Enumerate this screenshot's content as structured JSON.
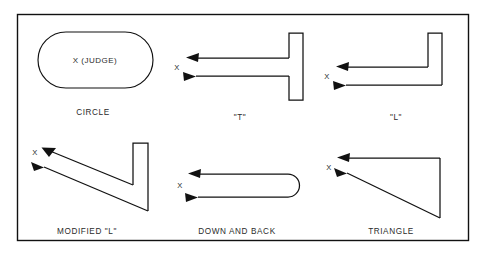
{
  "figure": {
    "background_color": "#ffffff",
    "line_color": "#111111",
    "frame": {
      "x": 17,
      "y": 14,
      "width": 452,
      "height": 227
    }
  },
  "panels": [
    {
      "id": "circle",
      "label": "CIRCLE",
      "label_x": 93,
      "label_y": 112,
      "shape": "stadium",
      "marker_text": "X (JUDGE)",
      "marker_x": 95,
      "marker_y": 62
    },
    {
      "id": "t-shape",
      "label": "\"T\"",
      "label_x": 240,
      "label_y": 118,
      "shape": "t-path",
      "marker_text": "X",
      "marker_x": 180,
      "marker_y": 70
    },
    {
      "id": "l-shape",
      "label": "\"L\"",
      "label_x": 396,
      "label_y": 118,
      "shape": "l-path",
      "marker_text": "X",
      "marker_x": 330,
      "marker_y": 79
    },
    {
      "id": "modified-l",
      "label": "MODIFIED \"L\"",
      "label_x": 87,
      "label_y": 232,
      "shape": "modified-l-path",
      "marker_text": "X",
      "marker_x": 37,
      "marker_y": 153
    },
    {
      "id": "down-and-back",
      "label": "DOWN AND BACK",
      "label_x": 237,
      "label_y": 232,
      "shape": "u-turn-path",
      "marker_text": "X",
      "marker_x": 182,
      "marker_y": 185
    },
    {
      "id": "triangle",
      "label": "TRIANGLE",
      "label_x": 391,
      "label_y": 232,
      "shape": "triangle-path",
      "marker_text": "X",
      "marker_x": 331,
      "marker_y": 170
    }
  ]
}
